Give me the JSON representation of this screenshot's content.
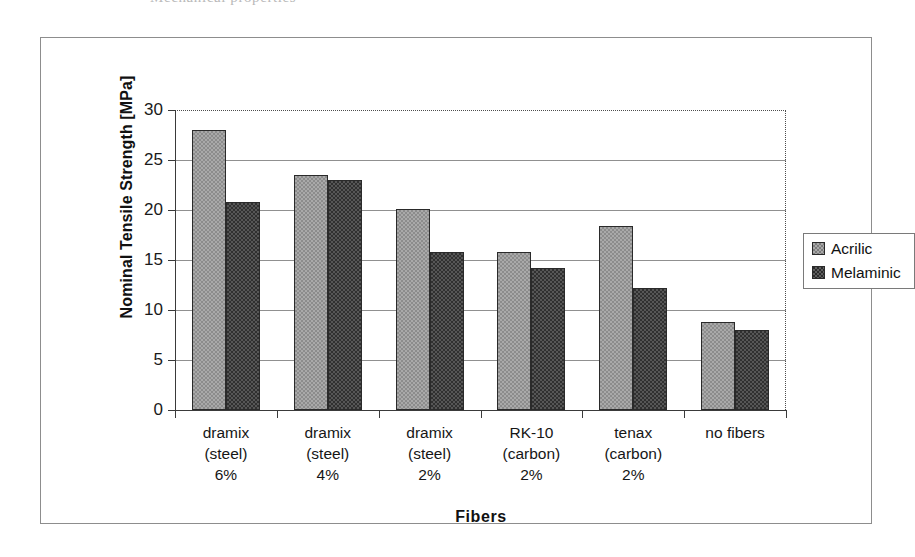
{
  "scan": {
    "top_text_remnant": "Mechanical properties"
  },
  "chart_data": {
    "type": "bar",
    "title": "",
    "xlabel": "Fibers",
    "ylabel": "Nominal Tensile Strength [MPa]",
    "ylim": [
      0,
      30
    ],
    "yticks": [
      0,
      5,
      10,
      15,
      20,
      25,
      30
    ],
    "ytick_labels": [
      "0",
      "5",
      "10",
      "15",
      "20",
      "25",
      "30"
    ],
    "grid": "horizontal",
    "legend_position": "right",
    "categories": [
      "dramix (steel) 6%",
      "dramix (steel) 4%",
      "dramix (steel) 2%",
      "RK-10 (carbon) 2%",
      "tenax (carbon) 2%",
      "no fibers"
    ],
    "category_lines": [
      [
        "dramix",
        "(steel)",
        "6%"
      ],
      [
        "dramix",
        "(steel)",
        "4%"
      ],
      [
        "dramix",
        "(steel)",
        "2%"
      ],
      [
        "RK-10",
        "(carbon)",
        "2%"
      ],
      [
        "tenax",
        "(carbon)",
        "2%"
      ],
      [
        "no fibers",
        "",
        ""
      ]
    ],
    "series": [
      {
        "name": "Acrilic",
        "color": "#a9a9a9",
        "values": [
          28.0,
          23.5,
          20.1,
          15.8,
          18.4,
          8.8
        ]
      },
      {
        "name": "Melaminic",
        "color": "#2c2c2c",
        "values": [
          20.8,
          23.0,
          15.8,
          14.2,
          12.2,
          8.0
        ]
      }
    ]
  }
}
